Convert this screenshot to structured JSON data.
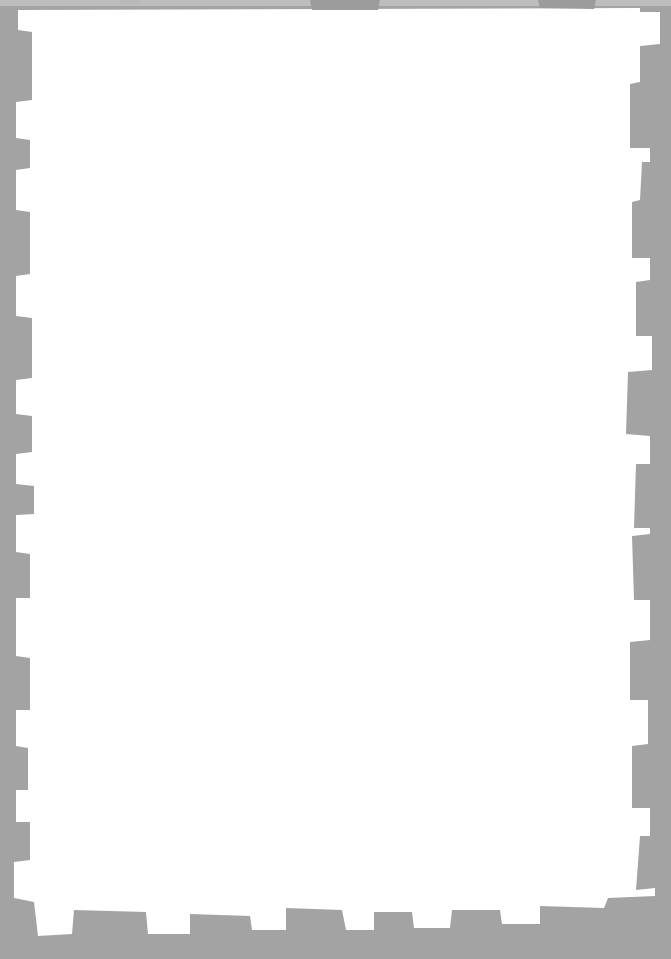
{
  "page": {
    "background_color": "#a3a3a3",
    "paper_color": "#ffffff",
    "text": []
  }
}
